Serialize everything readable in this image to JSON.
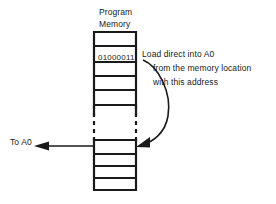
{
  "diagram": {
    "title": {
      "line1": "Program",
      "line2": "Memory"
    },
    "memory_cell_value": "01000011",
    "annotation": {
      "line1": "Load direct into A0",
      "line2": "from the memory location",
      "line3": "with this address"
    },
    "output_label": "To A0",
    "colors": {
      "stroke": "#1a1a1a",
      "background": "#ffffff",
      "text": "#1a1a1a"
    },
    "structure": {
      "column_left_x": 93,
      "column_right_x": 137,
      "top_y": 31,
      "bottom_y": 190,
      "upper_rows": 6,
      "lower_rows": 5,
      "break_dashed": true,
      "highlighted_row_index": 1,
      "target_row_index": 7
    }
  }
}
